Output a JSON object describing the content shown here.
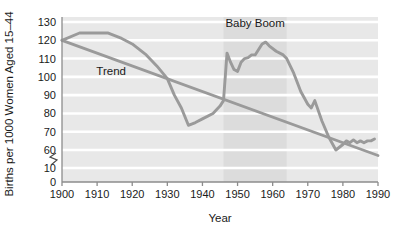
{
  "chart_data": {
    "type": "line",
    "title": "",
    "xlabel": "Year",
    "ylabel": "Births per 1000 Women Aged 15–44",
    "xlim": [
      1900,
      1990
    ],
    "ylim": [
      0,
      130
    ],
    "y_axis_break": {
      "from": 10,
      "to": 60,
      "symbol": "zigzag"
    },
    "grid": "horizontal-white",
    "legend": "none",
    "x_ticks": [
      1900,
      1910,
      1920,
      1930,
      1940,
      1950,
      1960,
      1970,
      1980,
      1990
    ],
    "x_tick_labels": [
      "1900",
      "1910",
      "1920",
      "1930",
      "1940",
      "1950",
      "1960",
      "1970",
      "1980",
      "1990"
    ],
    "y_ticks": [
      0,
      10,
      60,
      70,
      80,
      90,
      100,
      110,
      120,
      130
    ],
    "y_tick_labels": [
      "0",
      "10",
      "60",
      "70",
      "80",
      "90",
      "100",
      "110",
      "120",
      "130"
    ],
    "annotations": [
      {
        "text": "Baby Boom",
        "x": 1955,
        "y": 127,
        "name": "baby-boom-label"
      },
      {
        "text": "Trend",
        "x": 1914,
        "y": 101,
        "name": "trend-label"
      }
    ],
    "shaded_bands": [
      {
        "name": "baby-boom-band",
        "x_start": 1946,
        "x_end": 1964,
        "color": "#dcdcdc"
      }
    ],
    "series": [
      {
        "name": "Birth rate",
        "color": "#9a9a9a",
        "x": [
          1900,
          1905,
          1910,
          1913,
          1917,
          1920,
          1924,
          1927,
          1930,
          1932,
          1934,
          1936,
          1938,
          1940,
          1943,
          1945,
          1946,
          1947,
          1948,
          1949,
          1950,
          1951,
          1952,
          1953,
          1954,
          1955,
          1956,
          1957,
          1958,
          1959,
          1961,
          1963,
          1964,
          1966,
          1968,
          1970,
          1971,
          1972,
          1974,
          1976,
          1978,
          1980,
          1981,
          1982,
          1983,
          1984,
          1985,
          1986,
          1987,
          1988,
          1989
        ],
        "y": [
          120,
          124,
          124,
          124,
          121,
          118,
          112,
          106,
          99,
          90,
          83,
          73.5,
          75,
          77,
          80,
          84,
          87,
          113,
          108,
          104,
          103,
          108,
          110,
          110.5,
          112,
          112,
          115,
          118,
          119,
          117,
          114,
          112,
          110,
          102,
          92,
          85,
          83,
          87,
          76,
          67,
          60,
          63,
          65,
          64,
          65.5,
          64,
          65,
          64,
          65,
          65,
          66
        ]
      },
      {
        "name": "Trend",
        "color": "#9a9a9a",
        "x": [
          1900,
          1990
        ],
        "y": [
          120,
          57
        ]
      }
    ]
  },
  "axis": {
    "x_title": "Year",
    "y_title": "Births per 1000 Women Aged 15–44"
  },
  "colors": {
    "plot_background": "#e8e8e8",
    "band": "#dcdcdc",
    "gridline": "#ffffff",
    "line": "#9a9a9a",
    "axis": "#8c8c8c",
    "text": "#1a1a1a"
  }
}
